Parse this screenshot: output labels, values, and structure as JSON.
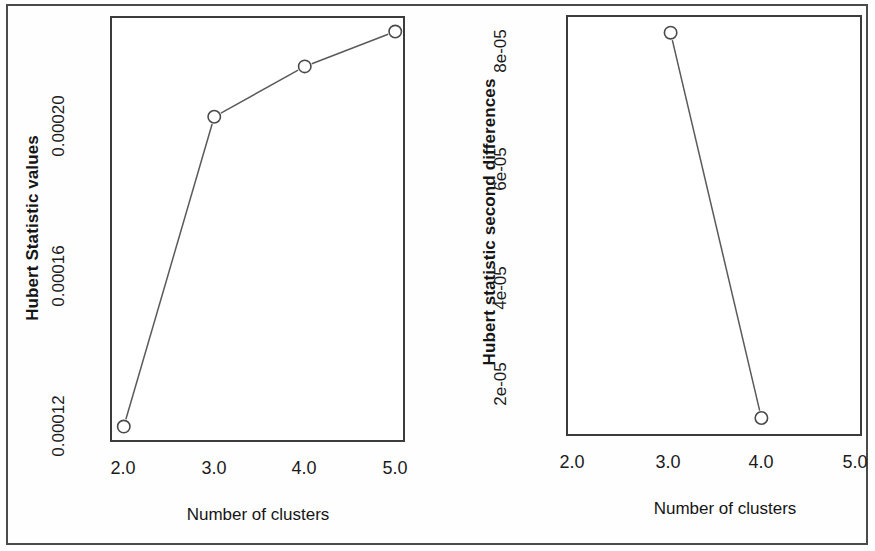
{
  "figure": {
    "background_color": "#fefefe",
    "frame_color": "#3c3c3c",
    "line_color": "#5a5a5a",
    "marker_color": "#4a4a4a"
  },
  "chart_data": [
    {
      "type": "line",
      "panel": "left",
      "title": "",
      "xlabel": "Number of clusters",
      "ylabel": "Hubert Statistic values",
      "x": [
        2.0,
        3.0,
        4.0,
        5.0
      ],
      "values": [
        0.000119,
        0.000199,
        0.000212,
        0.000221
      ],
      "xticklabels": [
        "2.0",
        "3.0",
        "4.0",
        "5.0"
      ],
      "xticks": [
        2.0,
        3.0,
        4.0,
        5.0
      ],
      "yticklabels": [
        "0.00012",
        "0.00016",
        "0.00020"
      ],
      "yticks": [
        0.00012,
        0.00016,
        0.0002
      ],
      "xlim": [
        1.87,
        5.13
      ],
      "ylim": [
        0.0001145,
        0.0002245
      ],
      "grid": false,
      "legend": "none",
      "marker": "open-circle"
    },
    {
      "type": "line",
      "panel": "right",
      "title": "",
      "xlabel": "Number of clusters",
      "ylabel": "Hubert statistic second differences",
      "x": [
        3.0,
        4.0
      ],
      "values": [
        8.66e-05,
        1.54e-05
      ],
      "xticklabels": [
        "2.0",
        "3.0",
        "4.0",
        "5.0"
      ],
      "xticks": [
        2.0,
        3.0,
        4.0,
        5.0
      ],
      "yticklabels": [
        "2e-05",
        "4e-05",
        "6e-05",
        "8e-05"
      ],
      "yticks": [
        2e-05,
        4e-05,
        6e-05,
        8e-05
      ],
      "xlim": [
        1.87,
        5.13
      ],
      "ylim": [
        1.17e-05,
        8.95e-05
      ],
      "grid": false,
      "legend": "none",
      "marker": "open-circle"
    }
  ],
  "left_panel": {
    "ylabel": "Hubert Statistic values",
    "xlabel": "Number of clusters",
    "yticks": [
      {
        "label": "0.00020"
      },
      {
        "label": "0.00016"
      },
      {
        "label": "0.00012"
      }
    ],
    "xticks": [
      {
        "label": "2.0"
      },
      {
        "label": "3.0"
      },
      {
        "label": "4.0"
      },
      {
        "label": "5.0"
      }
    ]
  },
  "right_panel": {
    "ylabel": "Hubert statistic second differences",
    "xlabel": "Number of clusters",
    "yticks": [
      {
        "label": "8e-05"
      },
      {
        "label": "6e-05"
      },
      {
        "label": "4e-05"
      },
      {
        "label": "2e-05"
      }
    ],
    "xticks": [
      {
        "label": "2.0"
      },
      {
        "label": "3.0"
      },
      {
        "label": "4.0"
      },
      {
        "label": "5.0"
      }
    ]
  }
}
